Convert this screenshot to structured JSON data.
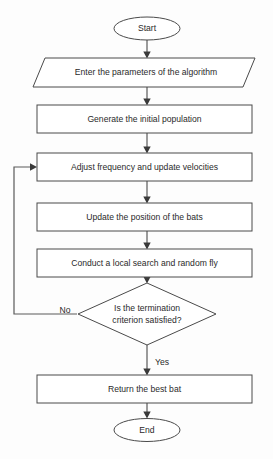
{
  "diagram": {
    "background_color": "#fdfdfd",
    "shape_fill": "#ffffff",
    "shape_stroke": "#4a4a4a",
    "line_color": "#5a5a5a",
    "text_color": "#2a2a2a"
  },
  "nodes": {
    "start": {
      "label": "Start",
      "shape": "ellipse"
    },
    "input_params": {
      "label": "Enter the parameters of the algorithm",
      "shape": "parallelogram"
    },
    "generate_population": {
      "label": "Generate the initial population",
      "shape": "rectangle"
    },
    "adjust_frequency": {
      "label": "Adjust frequency and update velocities",
      "shape": "rectangle"
    },
    "update_position": {
      "label": "Update the position of the bats",
      "shape": "rectangle"
    },
    "local_search": {
      "label": "Conduct a local search and random fly",
      "shape": "rectangle"
    },
    "decision": {
      "shape": "diamond",
      "label_line1": "Is the termination",
      "label_line2": "criterion satisfied?"
    },
    "return_best": {
      "label": "Return the best bat",
      "shape": "rectangle"
    },
    "end": {
      "label": "End",
      "shape": "ellipse"
    }
  },
  "edge_labels": {
    "no": "No",
    "yes": "Yes"
  }
}
